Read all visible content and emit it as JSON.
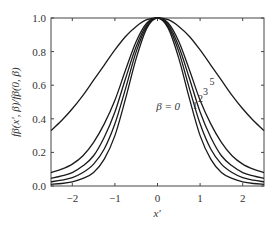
{
  "chart_data": {
    "type": "line",
    "title": "",
    "xlabel": "x'",
    "ylabel": "fβ(x', β)/fβ(0, β)",
    "xlim": [
      -2.5,
      2.5
    ],
    "ylim": [
      0.0,
      1.0
    ],
    "xticks": [
      -2,
      -1,
      0,
      1,
      2
    ],
    "xtick_labels": [
      "−2",
      "−1",
      "0",
      "1",
      "2"
    ],
    "yticks": [
      0.0,
      0.2,
      0.4,
      0.6,
      0.8,
      1.0
    ],
    "ytick_labels": [
      "0.0",
      "0.2",
      "0.4",
      "0.6",
      "0.8",
      "1.0"
    ],
    "grid": false,
    "legend": "none (inline curve labels)",
    "x": [
      -2.5,
      -2.25,
      -2.0,
      -1.75,
      -1.5,
      -1.25,
      -1.0,
      -0.75,
      -0.5,
      -0.25,
      0.0,
      0.25,
      0.5,
      0.75,
      1.0,
      1.25,
      1.5,
      1.75,
      2.0,
      2.25,
      2.5
    ],
    "series": [
      {
        "name": "β = 0",
        "label": "β = 0",
        "values": [
          0.01,
          0.015,
          0.025,
          0.045,
          0.08,
          0.16,
          0.3,
          0.52,
          0.76,
          0.94,
          1.0,
          0.94,
          0.76,
          0.52,
          0.3,
          0.16,
          0.08,
          0.045,
          0.025,
          0.015,
          0.01
        ]
      },
      {
        "name": "β = 1",
        "label": "1",
        "values": [
          0.025,
          0.035,
          0.05,
          0.08,
          0.13,
          0.22,
          0.37,
          0.58,
          0.8,
          0.95,
          1.0,
          0.95,
          0.8,
          0.58,
          0.37,
          0.22,
          0.13,
          0.08,
          0.05,
          0.035,
          0.025
        ]
      },
      {
        "name": "β = 2",
        "label": "2",
        "values": [
          0.045,
          0.06,
          0.08,
          0.12,
          0.18,
          0.29,
          0.44,
          0.64,
          0.83,
          0.96,
          1.0,
          0.96,
          0.83,
          0.64,
          0.44,
          0.29,
          0.18,
          0.12,
          0.08,
          0.06,
          0.045
        ]
      },
      {
        "name": "β = 3",
        "label": "3",
        "values": [
          0.08,
          0.1,
          0.13,
          0.18,
          0.26,
          0.37,
          0.51,
          0.69,
          0.86,
          0.97,
          1.0,
          0.97,
          0.86,
          0.69,
          0.51,
          0.37,
          0.26,
          0.18,
          0.13,
          0.1,
          0.08
        ]
      },
      {
        "name": "β = 5",
        "label": "5",
        "values": [
          0.33,
          0.39,
          0.46,
          0.54,
          0.63,
          0.72,
          0.81,
          0.89,
          0.95,
          0.99,
          1.0,
          0.99,
          0.95,
          0.89,
          0.81,
          0.72,
          0.63,
          0.54,
          0.46,
          0.39,
          0.33
        ]
      }
    ],
    "annotations": [
      {
        "text": "β = 0",
        "x": 0.25,
        "y": 0.45
      },
      {
        "text": "1",
        "x": 0.82,
        "y": 0.46
      },
      {
        "text": "2",
        "x": 0.95,
        "y": 0.5
      },
      {
        "text": "3",
        "x": 1.07,
        "y": 0.54
      },
      {
        "text": "5",
        "x": 1.22,
        "y": 0.6
      }
    ]
  },
  "plot": {
    "color": "#1a1a1a",
    "frame_color": "#444444"
  }
}
